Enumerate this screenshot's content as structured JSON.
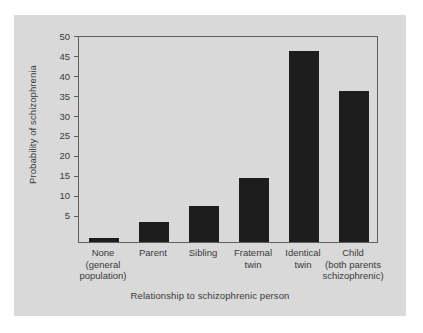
{
  "chart_data": {
    "type": "bar",
    "title": "",
    "subtitle": "",
    "xlabel": "Relationship to schizophrenic person",
    "ylabel": "Probability of schizophrenia",
    "categories": [
      "None\n(general\npopulation)",
      "Parent",
      "Sibling",
      "Fraternal\ntwin",
      "Identical\ntwin",
      "Child\n(both parents\nschizophrenic)"
    ],
    "values": [
      1,
      5,
      9,
      16,
      48,
      38
    ],
    "ylim": [
      0,
      52
    ],
    "yticks": [
      5,
      10,
      15,
      20,
      25,
      30,
      35,
      40,
      45,
      50
    ],
    "ytick_labels": [
      "5",
      "10",
      "15",
      "20",
      "25",
      "30",
      "35",
      "40",
      "45",
      "50"
    ],
    "grid": false,
    "legend": null,
    "bar_color": "#1d1d1d",
    "plot_background": "#d9d9d9",
    "axis_color": "#5e5e5e",
    "text_color": "#3a3a3a"
  }
}
